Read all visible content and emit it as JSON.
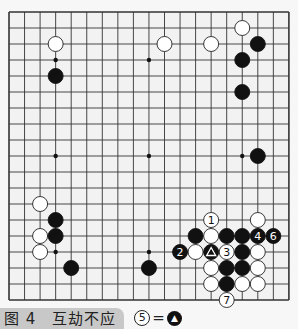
{
  "board": {
    "size": 19,
    "origin_x": 9,
    "origin_y": 12,
    "step_x": 15.55,
    "step_y": 16,
    "line_color": "#333333",
    "board_fill": "#f2f2f2",
    "star_points": [
      [
        3,
        3
      ],
      [
        9,
        3
      ],
      [
        15,
        3
      ],
      [
        3,
        9
      ],
      [
        9,
        9
      ],
      [
        15,
        9
      ],
      [
        3,
        15
      ],
      [
        9,
        15
      ],
      [
        15,
        15
      ]
    ],
    "stones": [
      {
        "color": "white",
        "col": 3,
        "row": 2
      },
      {
        "color": "black",
        "col": 3,
        "row": 4
      },
      {
        "color": "white",
        "col": 10,
        "row": 2
      },
      {
        "color": "white",
        "col": 13,
        "row": 2
      },
      {
        "color": "white",
        "col": 15,
        "row": 1
      },
      {
        "color": "black",
        "col": 16,
        "row": 2
      },
      {
        "color": "black",
        "col": 15,
        "row": 3
      },
      {
        "color": "black",
        "col": 15,
        "row": 5
      },
      {
        "color": "black",
        "col": 16,
        "row": 9
      },
      {
        "color": "white",
        "col": 2,
        "row": 12
      },
      {
        "color": "black",
        "col": 3,
        "row": 13
      },
      {
        "color": "white",
        "col": 2,
        "row": 14
      },
      {
        "color": "black",
        "col": 3,
        "row": 14
      },
      {
        "color": "white",
        "col": 2,
        "row": 15
      },
      {
        "color": "black",
        "col": 4,
        "row": 16
      },
      {
        "color": "black",
        "col": 9,
        "row": 16
      },
      {
        "color": "white",
        "col": 13,
        "row": 13,
        "label": "1"
      },
      {
        "color": "white",
        "col": 16,
        "row": 13
      },
      {
        "color": "black",
        "col": 12,
        "row": 14
      },
      {
        "color": "white",
        "col": 13,
        "row": 14
      },
      {
        "color": "black",
        "col": 14,
        "row": 14
      },
      {
        "color": "black",
        "col": 15,
        "row": 14
      },
      {
        "color": "black",
        "col": 16,
        "row": 14,
        "label": "4"
      },
      {
        "color": "black",
        "col": 17,
        "row": 14,
        "label": "6"
      },
      {
        "color": "black",
        "col": 11,
        "row": 15,
        "label": "2"
      },
      {
        "color": "white",
        "col": 12,
        "row": 15
      },
      {
        "color": "black",
        "col": 13,
        "row": 15,
        "mark": "triangle"
      },
      {
        "color": "white",
        "col": 14,
        "row": 15,
        "label": "3"
      },
      {
        "color": "black",
        "col": 15,
        "row": 15
      },
      {
        "color": "white",
        "col": 16,
        "row": 15
      },
      {
        "color": "white",
        "col": 13,
        "row": 16
      },
      {
        "color": "black",
        "col": 14,
        "row": 16
      },
      {
        "color": "black",
        "col": 15,
        "row": 16
      },
      {
        "color": "white",
        "col": 16,
        "row": 16
      },
      {
        "color": "white",
        "col": 13,
        "row": 17
      },
      {
        "color": "black",
        "col": 14,
        "row": 17
      },
      {
        "color": "white",
        "col": 15,
        "row": 17
      },
      {
        "color": "white",
        "col": 16,
        "row": 17
      },
      {
        "color": "white",
        "col": 14,
        "row": 18,
        "label": "7"
      }
    ]
  },
  "caption": {
    "figure_label": "图 4　互劫不应",
    "note_move": "5",
    "note_equals": "=",
    "note_ref_mark": "triangle-black-stone"
  }
}
